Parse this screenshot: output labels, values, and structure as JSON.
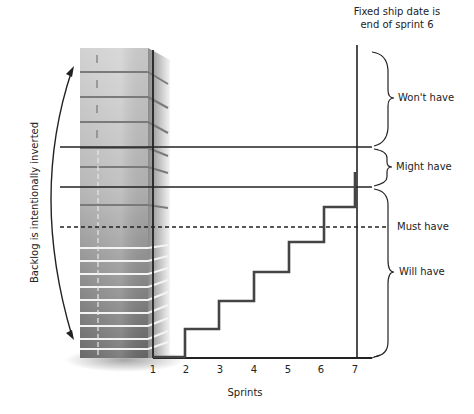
{
  "diagram": {
    "ship_date_note_line1": "Fixed ship date is",
    "ship_date_note_line2": "end of sprint 6",
    "backlog_note": "Backlog is intentionally inverted",
    "x_axis_label": "Sprints",
    "ticks": [
      "1",
      "2",
      "3",
      "4",
      "5",
      "6",
      "7"
    ],
    "categories": {
      "wont_have": "Won't have",
      "might_have": "Might have",
      "must_have": "Must have",
      "will_have": "Will have"
    },
    "colors": {
      "line": "#222222",
      "step": "#444444",
      "stack_light": "#c8c8c8",
      "stack_dark": "#6e6e6e"
    }
  }
}
